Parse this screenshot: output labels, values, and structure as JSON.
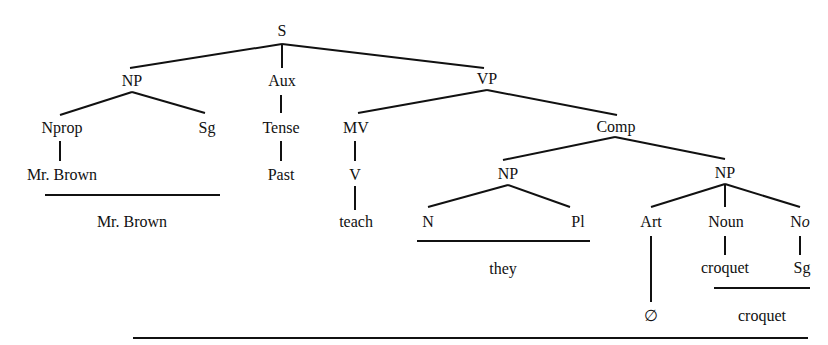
{
  "diagram": {
    "type": "phrase-structure-tree",
    "nodes": {
      "S": "S",
      "NP_subj": "NP",
      "Aux": "Aux",
      "VP": "VP",
      "Nprop": "Nprop",
      "Sg_subj": "Sg",
      "Tense": "Tense",
      "MV": "MV",
      "Comp": "Comp",
      "MrBrown_leaf": "Mr. Brown",
      "Past": "Past",
      "V": "V",
      "NP_obj1": "NP",
      "NP_obj2": "NP",
      "teach": "teach",
      "N": "N",
      "Pl": "Pl",
      "Art": "Art",
      "Noun": "Noun",
      "No_prefix": "N",
      "No_suffix": "o",
      "croquet_leaf": "croquet",
      "Sg_obj": "Sg",
      "null_article": "∅"
    },
    "realizations": {
      "mr_brown": "Mr. Brown",
      "they": "they",
      "croquet": "croquet"
    }
  }
}
